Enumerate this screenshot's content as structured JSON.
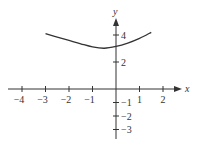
{
  "chart_data": {
    "type": "line",
    "title": "",
    "xlabel": "x",
    "ylabel": "y",
    "xlim": [
      -4.2,
      2.7
    ],
    "ylim": [
      -3.6,
      5.3
    ],
    "grid": false,
    "legend": null,
    "x_ticks": [
      -4,
      -3,
      -2,
      -1,
      1,
      2
    ],
    "x_tick_labels": [
      "−4",
      "−3",
      "−2",
      "−1",
      "1",
      "2"
    ],
    "y_ticks": [
      4,
      2,
      -1,
      -2,
      -3
    ],
    "y_tick_labels": [
      "4",
      "2",
      "−1",
      "−2",
      "−3"
    ],
    "series": [
      {
        "name": "curve",
        "x": [
          -3,
          -2.5,
          -2,
          -1.5,
          -1,
          -0.5,
          0,
          0.5,
          1,
          1.5
        ],
        "y": [
          4.1,
          3.85,
          3.6,
          3.35,
          3.12,
          3.02,
          3.15,
          3.4,
          3.75,
          4.2
        ]
      }
    ],
    "colors": {
      "axis": "#333333",
      "curve": "#333333"
    }
  }
}
